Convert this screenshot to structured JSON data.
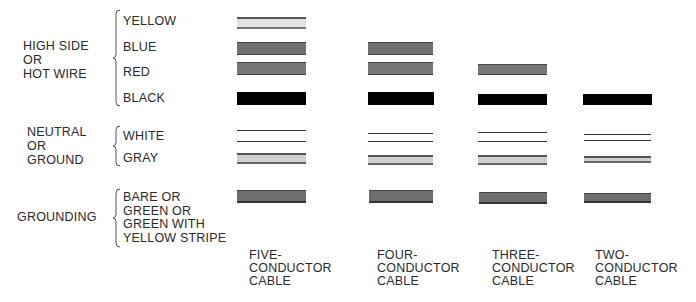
{
  "groups": [
    {
      "label": "HIGH SIDE\nOR\nHOT WIRE",
      "wires": [
        "YELLOW",
        "BLUE",
        "RED",
        "BLACK"
      ]
    },
    {
      "label": "NEUTRAL\nOR\nGROUND",
      "wires": [
        "WHITE",
        "GRAY"
      ]
    },
    {
      "label": "GROUNDING",
      "wires": [
        "BARE OR\nGREEN OR\nGREEN WITH\nYELLOW STRIPE"
      ]
    }
  ],
  "wire_labels": {
    "yellow": "YELLOW",
    "blue": "BLUE",
    "red": "RED",
    "black": "BLACK",
    "white": "WHITE",
    "gray": "GRAY",
    "bare": "BARE OR\nGREEN OR\nGREEN WITH\nYELLOW STRIPE"
  },
  "group_labels": {
    "hot": "HIGH SIDE\nOR\nHOT WIRE",
    "neutral": "NEUTRAL\nOR\nGROUND",
    "grounding": "GROUNDING"
  },
  "cables": [
    {
      "label": "FIVE-\nCONDUCTOR\nCABLE",
      "wires": [
        "yellow",
        "blue",
        "red",
        "black",
        "white",
        "gray",
        "bare"
      ]
    },
    {
      "label": "FOUR-\nCONDUCTOR\nCABLE",
      "wires": [
        "blue",
        "red",
        "black",
        "white",
        "gray",
        "bare"
      ]
    },
    {
      "label": "THREE-\nCONDUCTOR\nCABLE",
      "wires": [
        "red",
        "black",
        "white",
        "gray",
        "bare"
      ]
    },
    {
      "label": "TWO-\nCONDUCTOR\nCABLE",
      "wires": [
        "black",
        "white",
        "gray",
        "bare"
      ]
    }
  ],
  "colors": {
    "black": "#000000",
    "dark_gray": "#707070",
    "light_gray": "#d0d0d0",
    "yellow_fill": "#e2e2e2"
  }
}
